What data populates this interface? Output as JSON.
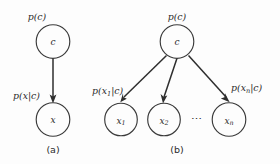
{
  "figure": {
    "colors": {
      "background": "#fdfdfd",
      "stroke": "#2e2e2e",
      "circle_stroke": "#3a3a3a",
      "text": "#2b2b2b"
    }
  },
  "panel_a": {
    "caption": "(a)",
    "prior_label": "p(c)",
    "conditional_label": "p(x|c)",
    "nodes": [
      {
        "id": "c",
        "label": "c",
        "sub": ""
      },
      {
        "id": "x",
        "label": "x",
        "sub": ""
      }
    ]
  },
  "panel_b": {
    "caption": "(b)",
    "prior_label": "p(c)",
    "conditional_label_first": "p(x",
    "conditional_sub_first": "1",
    "conditional_label_first_tail": "|c)",
    "conditional_label_last": "p(x",
    "conditional_sub_last": "n",
    "conditional_label_last_tail": "|c)",
    "ellipsis": "⋯",
    "nodes": [
      {
        "id": "c",
        "label": "c",
        "sub": ""
      },
      {
        "id": "x1",
        "label": "x",
        "sub": "1"
      },
      {
        "id": "x2",
        "label": "x",
        "sub": "2"
      },
      {
        "id": "xn",
        "label": "x",
        "sub": "n"
      }
    ]
  }
}
